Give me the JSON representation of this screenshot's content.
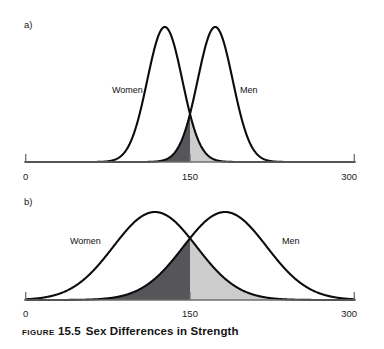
{
  "figure": {
    "caption_label": "Figure",
    "caption_number": "15.5",
    "caption_title": "Sex Differences in Strength",
    "background_color": "#ffffff",
    "curve_stroke_color": "#0c0c0c",
    "axis_color": "#6e6e6e",
    "women_overlap_fill": "#56565a",
    "men_overlap_fill": "#cccccc"
  },
  "panels": [
    {
      "id": "a",
      "letter": "a)",
      "women_label": "Women",
      "men_label": "Men",
      "axis": {
        "ticks": [
          "0",
          "150",
          "300"
        ],
        "min": 0,
        "max": 300,
        "midpoint": 150
      }
    },
    {
      "id": "b",
      "letter": "b)",
      "women_label": "Women",
      "men_label": "Men",
      "axis": {
        "ticks": [
          "0",
          "150",
          "300"
        ],
        "min": 0,
        "max": 300,
        "midpoint": 150
      }
    }
  ],
  "chart_data": {
    "type": "line",
    "xlabel": "",
    "ylabel": "",
    "xlim": [
      0,
      300
    ],
    "grid": false,
    "legend_position": "inline-annotation",
    "panels": [
      {
        "id": "a",
        "label": "a)",
        "description": "Low within-sex variability: two narrow normal curves with small overlap at 150",
        "xticks": [
          0,
          150,
          300
        ],
        "xticklabels": [
          "0",
          "150",
          "300"
        ],
        "series": [
          {
            "name": "Women",
            "distribution": "normal",
            "mean": 127,
            "sd": 16,
            "annotation": "Women",
            "annotation_x": 75
          },
          {
            "name": "Men",
            "distribution": "normal",
            "mean": 173,
            "sd": 16,
            "annotation": "Men",
            "annotation_x": 200
          }
        ],
        "shaded_overlap": {
          "left_of_midpoint_fill": "#56565a",
          "right_of_midpoint_fill": "#cccccc",
          "midpoint": 150,
          "relative_overlap_area": "small"
        }
      },
      {
        "id": "b",
        "label": "b)",
        "description": "High within-sex variability: two wide normal curves with large overlap at 150",
        "xticks": [
          0,
          150,
          300
        ],
        "xticklabels": [
          "0",
          "150",
          "300"
        ],
        "series": [
          {
            "name": "Women",
            "distribution": "normal",
            "mean": 118,
            "sd": 38,
            "annotation": "Women",
            "annotation_x": 45
          },
          {
            "name": "Men",
            "distribution": "normal",
            "mean": 182,
            "sd": 38,
            "annotation": "Men",
            "annotation_x": 235
          }
        ],
        "shaded_overlap": {
          "left_of_midpoint_fill": "#56565a",
          "right_of_midpoint_fill": "#cccccc",
          "midpoint": 150,
          "relative_overlap_area": "large"
        }
      }
    ]
  }
}
